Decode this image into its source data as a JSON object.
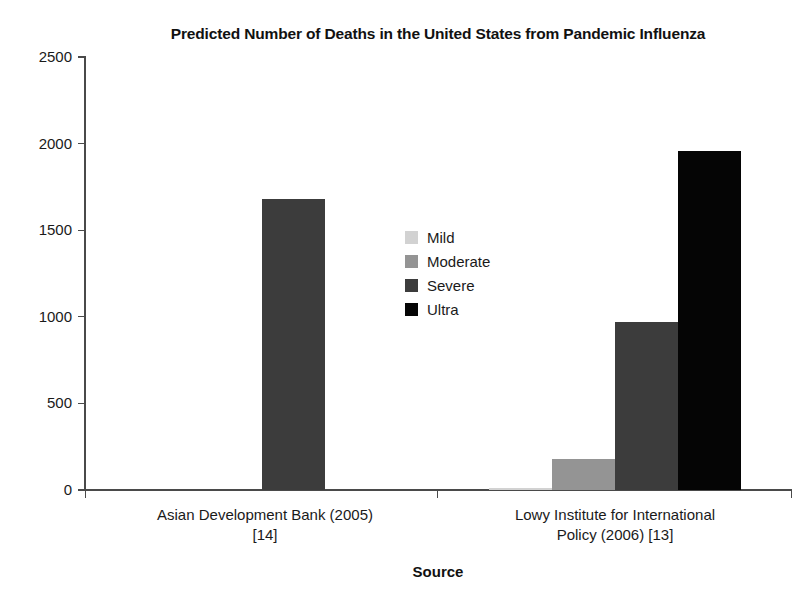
{
  "chart_data": {
    "type": "bar",
    "title": "Predicted Number of Deaths in the United States from Pandemic Influenza",
    "xlabel": "Source",
    "ylabel": "",
    "categories": [
      "Asian Development Bank (2005)\n[14]",
      "Lowy Institute for International\nPolicy (2006) [13]"
    ],
    "category_lines": [
      [
        "Asian Development Bank (2005)",
        "[14]"
      ],
      [
        "Lowy Institute for International",
        "Policy (2006) [13]"
      ]
    ],
    "series": [
      {
        "name": "Mild",
        "color": "#d2d2d2",
        "values": [
          0,
          10
        ]
      },
      {
        "name": "Moderate",
        "color": "#949494",
        "values": [
          0,
          180
        ]
      },
      {
        "name": "Severe",
        "color": "#3c3c3c",
        "values": [
          1680,
          970
        ]
      },
      {
        "name": "Ultra",
        "color": "#050505",
        "values": [
          0,
          1960
        ]
      }
    ],
    "ylim": [
      0,
      2500
    ],
    "yticks": [
      0,
      500,
      1000,
      1500,
      2000,
      2500
    ],
    "ytick_labels": [
      "0",
      "500",
      "1000",
      "1500",
      "2000",
      "2500"
    ],
    "grid": false,
    "legend_position": "center",
    "legend_entries": [
      "Mild",
      "Moderate",
      "Severe",
      "Ultra"
    ]
  },
  "style": {
    "background": "#ffffff",
    "axis_color": "#4a4a4a",
    "text_color": "#1a1a1a"
  }
}
